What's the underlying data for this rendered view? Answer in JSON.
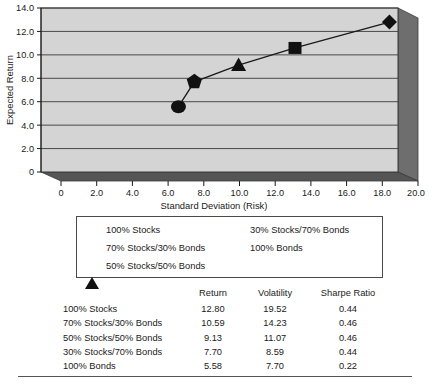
{
  "chart_data": {
    "type": "scatter",
    "title": "",
    "xlabel": "Standard Deviation (Risk)",
    "ylabel": "Expected Return",
    "xlim": [
      0,
      20
    ],
    "ylim": [
      0,
      14
    ],
    "xticks": [
      "0",
      "2.0",
      "4.0",
      "6.0",
      "8.0",
      "10.0",
      "12.0",
      "14.0",
      "16.0",
      "18.0",
      "20.0"
    ],
    "yticks": [
      "0",
      "2.0",
      "4.0",
      "6.0",
      "8.0",
      "10.0",
      "12.0",
      "14.0"
    ],
    "grid": "horizontal",
    "legend_position": "below-plot",
    "style": "3d-area",
    "points": [
      {
        "label": "100% Stocks",
        "x": 19.52,
        "y": 12.8,
        "marker": "diamond"
      },
      {
        "label": "70% Stocks/30% Bonds",
        "x": 14.23,
        "y": 10.59,
        "marker": "square"
      },
      {
        "label": "50% Stocks/50% Bonds",
        "x": 11.07,
        "y": 9.13,
        "marker": "triangle"
      },
      {
        "label": "30% Stocks/70% Bonds",
        "x": 8.59,
        "y": 7.7,
        "marker": "pentagon"
      },
      {
        "label": "100% Bonds",
        "x": 7.7,
        "y": 5.58,
        "marker": "circle"
      }
    ]
  },
  "legend": {
    "left_items": [
      {
        "marker": "diamond",
        "label": "100% Stocks"
      },
      {
        "marker": "square",
        "label": "70% Stocks/30% Bonds"
      },
      {
        "marker": "triangle",
        "label": "50% Stocks/50% Bonds"
      }
    ],
    "right_items": [
      {
        "marker": "pentagon",
        "label": "30% Stocks/70% Bonds"
      },
      {
        "marker": "circle",
        "label": "100% Bonds"
      }
    ]
  },
  "table": {
    "headers": [
      "",
      "Return",
      "Volatility",
      "Sharpe Ratio"
    ],
    "rows": [
      {
        "name": "100% Stocks",
        "return": "12.80",
        "volatility": "19.52",
        "sharpe": "0.44"
      },
      {
        "name": "70% Stocks/30% Bonds",
        "return": "10.59",
        "volatility": "14.23",
        "sharpe": "0.46"
      },
      {
        "name": "50% Stocks/50% Bonds",
        "return": "9.13",
        "volatility": "11.07",
        "sharpe": "0.46"
      },
      {
        "name": "30% Stocks/70% Bonds",
        "return": "7.70",
        "volatility": "8.59",
        "sharpe": "0.44"
      },
      {
        "name": "100% Bonds",
        "return": "5.58",
        "volatility": "7.70",
        "sharpe": "0.22"
      }
    ]
  },
  "colors": {
    "plot_face": "#d4d4d4",
    "plot_side": "#6e6e6e",
    "plot_floor": "#555555",
    "marker": "#111111",
    "grid": "#3a3a3a",
    "text": "#1a1a1a"
  }
}
